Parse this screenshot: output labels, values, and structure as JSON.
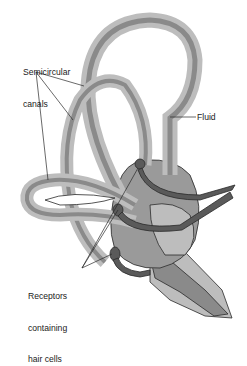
{
  "labels": {
    "canals_line1": "Semicircular",
    "canals_line2": "canals",
    "fluid": "Fluid",
    "receptors_line1": "Receptors",
    "receptors_line2": "containing",
    "receptors_line3": "hair cells"
  },
  "colors": {
    "background": "#ffffff",
    "outer_membrane": "#bdbdbd",
    "inner_duct": "#8a8a8a",
    "body_mid": "#9a9a9a",
    "nerve": "#5a5a5a",
    "outline": "#2a2a2a",
    "text": "#1a1a1a"
  }
}
